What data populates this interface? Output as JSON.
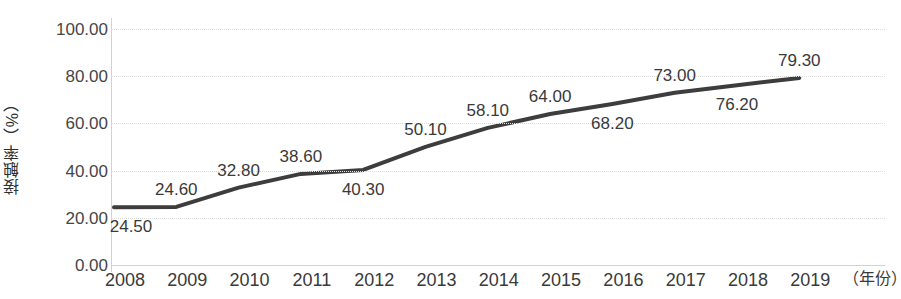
{
  "chart_data": {
    "type": "line",
    "title": "",
    "xlabel": "（年份）",
    "ylabel": "接触率（%）",
    "x": [
      "2008",
      "2009",
      "2010",
      "2011",
      "2012",
      "2013",
      "2014",
      "2015",
      "2016",
      "2017",
      "2018",
      "2019"
    ],
    "categories": [
      "2008",
      "2009",
      "2010",
      "2011",
      "2012",
      "2013",
      "2014",
      "2015",
      "2016",
      "2017",
      "2018",
      "2019"
    ],
    "values": [
      24.5,
      24.6,
      32.8,
      38.6,
      40.3,
      50.1,
      58.1,
      64.0,
      68.2,
      73.0,
      76.2,
      79.3
    ],
    "point_labels": [
      "24.50",
      "24.60",
      "32.80",
      "38.60",
      "40.30",
      "50.10",
      "58.10",
      "64.00",
      "68.20",
      "73.00",
      "76.20",
      "79.30"
    ],
    "label_positions": [
      "below",
      "above",
      "above",
      "above",
      "below",
      "above",
      "above",
      "above",
      "below",
      "above",
      "below",
      "above"
    ],
    "ylim": [
      0,
      100
    ],
    "ytick_values": [
      100,
      80,
      60,
      40,
      20,
      0
    ],
    "ytick_labels": [
      "100.00",
      "80.00",
      "60.00",
      "40.00",
      "20.00",
      "0.00"
    ],
    "grid": true,
    "legend": "none",
    "line_color": "#3d3d3d",
    "line_width": 4,
    "grid_color": "#dcdcdc",
    "axis_color": "#d2d2d2",
    "background": "#ffffff"
  },
  "axes": {
    "y_title": "接触率（%）",
    "x_title": "（年份）"
  }
}
